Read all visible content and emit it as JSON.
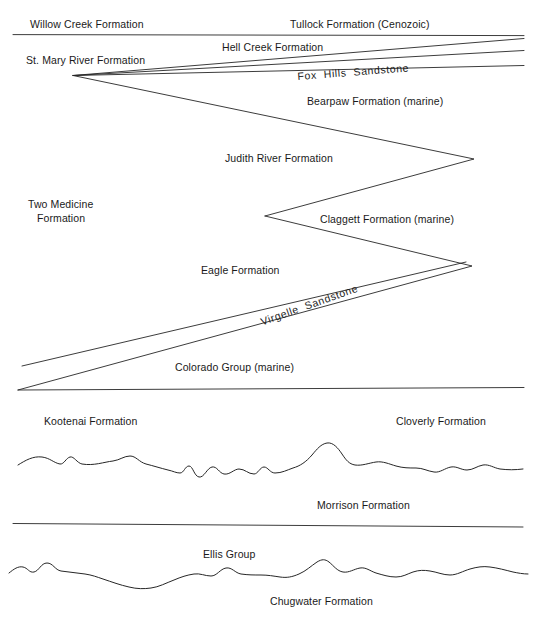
{
  "figure": {
    "type": "stratigraphic-cross-section",
    "width": 538,
    "height": 622,
    "background_color": "#ffffff",
    "line_color": "#262626",
    "text_color": "#1a1a1a"
  },
  "labels": [
    {
      "id": "willow-creek",
      "text": "Willow Creek Formation",
      "x": 30,
      "y": 18,
      "rotate": 0,
      "align": "left"
    },
    {
      "id": "tullock",
      "text": "Tullock Formation (Cenozoic)",
      "x": 290,
      "y": 18,
      "rotate": 0,
      "align": "left"
    },
    {
      "id": "hell-creek",
      "text": "Hell Creek Formation",
      "x": 222,
      "y": 41,
      "rotate": 0,
      "align": "left"
    },
    {
      "id": "st-mary-river",
      "text": "St. Mary River Formation",
      "x": 26,
      "y": 54,
      "rotate": 0,
      "align": "left"
    },
    {
      "id": "fox-hills",
      "text": "Fox  Hills  Sandstone",
      "x": 297,
      "y": 70,
      "rotate": -4.4,
      "align": "left"
    },
    {
      "id": "bearpaw",
      "text": "Bearpaw Formation (marine)",
      "x": 307,
      "y": 95,
      "rotate": 0,
      "align": "left"
    },
    {
      "id": "judith-river",
      "text": "Judith River Formation",
      "x": 225,
      "y": 152,
      "rotate": 0,
      "align": "left"
    },
    {
      "id": "two-medicine-1",
      "text": "Two Medicine",
      "x": 28,
      "y": 198,
      "rotate": 0,
      "align": "left"
    },
    {
      "id": "two-medicine-2",
      "text": "Formation",
      "x": 37,
      "y": 212,
      "rotate": 0,
      "align": "left"
    },
    {
      "id": "claggett",
      "text": "Claggett Formation (marine)",
      "x": 320,
      "y": 213,
      "rotate": 0,
      "align": "left"
    },
    {
      "id": "eagle",
      "text": "Eagle Formation",
      "x": 201,
      "y": 264,
      "rotate": 0,
      "align": "left"
    },
    {
      "id": "virgelle",
      "text": "Virgelle  Sandstone",
      "x": 259,
      "y": 316,
      "rotate": -19.5,
      "align": "left"
    },
    {
      "id": "colorado-group",
      "text": "Colorado Group (marine)",
      "x": 175,
      "y": 361,
      "rotate": 0,
      "align": "left"
    },
    {
      "id": "kootenai",
      "text": "Kootenai Formation",
      "x": 44,
      "y": 415,
      "rotate": 0,
      "align": "left"
    },
    {
      "id": "cloverly",
      "text": "Cloverly Formation",
      "x": 396,
      "y": 415,
      "rotate": 0,
      "align": "left"
    },
    {
      "id": "morrison",
      "text": "Morrison Formation",
      "x": 317,
      "y": 499,
      "rotate": 0,
      "align": "left"
    },
    {
      "id": "ellis-group",
      "text": "Ellis Group",
      "x": 203,
      "y": 548,
      "rotate": 0,
      "align": "left"
    },
    {
      "id": "chugwater",
      "text": "Chugwater Formation",
      "x": 270,
      "y": 595,
      "rotate": 0,
      "align": "left"
    }
  ],
  "contacts": [
    {
      "id": "tullock-base-line",
      "kind": "straight",
      "d": "M 13 34.6 L 524 35.6"
    },
    {
      "id": "hell-creek-top-wedge",
      "kind": "straight",
      "d": "M 73 75.5 L 524 38.5"
    },
    {
      "id": "fox-hills-upper-contact",
      "kind": "straight",
      "d": "M 73 75.5 L 524 50.5"
    },
    {
      "id": "fox-hills-lower-contact",
      "kind": "straight",
      "d": "M 73 75.5 L 524 65.5"
    },
    {
      "id": "bearpaw-judith-zigzag",
      "kind": "straight",
      "d": "M 73 75.5 L 474 159 L 265 216"
    },
    {
      "id": "claggett-eagle-zigzag",
      "kind": "straight",
      "d": "M 265 216 L 472 266 L 18 390"
    },
    {
      "id": "virgelle-top-contact",
      "kind": "straight",
      "d": "M 466 262 L 22 366"
    },
    {
      "id": "colorado-group-base",
      "kind": "straight",
      "d": "M 18 390 L 524 387.5"
    },
    {
      "id": "morrison-unconformity-upper",
      "kind": "wavy",
      "d": "M 18 465 C 26 460 33 456 42 457 C 50 458 54 463 60 464 C 64 464.5 66 458 70 457 C 74 456 77 463 82 464 C 94 466 104 462 113 461 C 120 460 124 456 130 456 C 136 456 139 462 146 464 C 154 466 160 468 168 470 C 173 471 176 473 180 473 C 184 473 185 466 189 466 C 193 466 194 476 199 477 C 204 478 207 468 212 467 C 217 466 219 473 224 474 C 230 475 234 469 239 469 C 245 469 248 474 254 474 C 258 474 260 467 264 467 C 268 467 270 473 275 473 C 282 473 287 470 293 468 C 300 466 306 462 312 455 C 317 449 321 444 327 443 C 333 442 338 448 342 454 C 346 460 349 464 355 465 C 362 466 369 463 376 462 C 383 461 389 464 396 466 C 403 468 409 468 416 468 C 423 468 427 471 434 472 C 440 473 445 468 451 467 C 457 466 461 470 467 470 C 473 470 477 466 483 465 C 489 464 494 468 500 469 C 508 470 515 470 523 469"
    },
    {
      "id": "ellis-group-top-line",
      "kind": "straight",
      "d": "M 13 523.5 L 523 527"
    },
    {
      "id": "chugwater-unconformity",
      "kind": "wavy",
      "d": "M 9 573 C 14 569 18 566 23 567 C 28 568 29 573 34 572 C 39 571 41 563 47 563 C 53 563 55 570 61 571 C 69 572 77 573 85 574 C 92 575 97 577 103 579 C 112 582 120 585 129 587 C 137 589 144 589 151 588 C 159 587 166 583 174 580 C 181 577 187 575 194 574 C 200 573 205 576 211 576 C 217 576 220 569 226 568 C 232 567 235 573 241 574 C 248 575 254 575 261 575 C 268 575 273 576 280 577 C 287 578 292 577 299 574 C 306 571 311 566 317 562 C 322 559 325 559 329 562 C 334 566 337 571 343 572 C 349 573 354 569 360 568 C 366 567 370 571 376 573 C 383 575 389 577 396 577 C 403 577 407 574 413 572 C 419 570 424 570 430 571 C 437 572 443 575 450 575 C 457 575 463 571 470 569 C 477 567 483 566 490 567 C 498 568 505 570 513 572 C 518 573 523 574 528 574"
    }
  ]
}
